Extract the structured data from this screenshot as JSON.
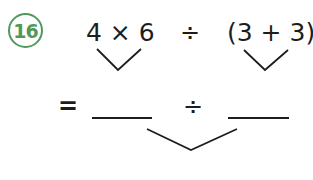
{
  "question": {
    "number": "16",
    "number_color": "#4f9a5a",
    "left_term": "4 × 6",
    "operator": "÷",
    "right_term": "(3 + 3)",
    "equals": "=",
    "blank_left": "",
    "second_operator": "÷",
    "blank_right": ""
  }
}
